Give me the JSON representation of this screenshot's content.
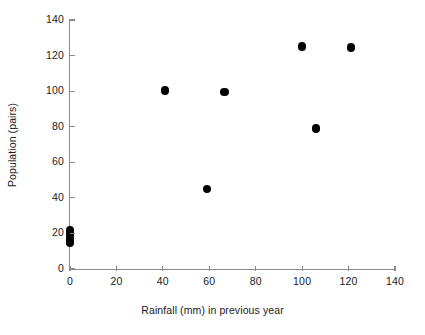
{
  "chart_data": {
    "type": "scatter",
    "title": "",
    "xlabel": "Rainfall (mm) in previous year",
    "ylabel": "Population (pairs)",
    "xlim": [
      0,
      140
    ],
    "ylim": [
      0,
      140
    ],
    "xticks": [
      0,
      20,
      40,
      60,
      80,
      100,
      120,
      140
    ],
    "yticks": [
      0,
      20,
      40,
      60,
      80,
      100,
      120,
      140
    ],
    "xtick_labels": [
      "0",
      "20",
      "40",
      "60",
      "80",
      "100",
      "120",
      "140"
    ],
    "ytick_labels": [
      "0",
      "20",
      "40",
      "60",
      "80",
      "100",
      "120",
      "140"
    ],
    "grid": false,
    "legend": null,
    "marker": {
      "shape": "circle",
      "color": "#000000",
      "size_px": 8.5
    },
    "axis_color": "#8a8a8a",
    "background": "#ffffff",
    "series": [
      {
        "name": "Population vs rainfall",
        "points": [
          {
            "x": 0,
            "y": 22
          },
          {
            "x": 0,
            "y": 20
          },
          {
            "x": 0,
            "y": 19
          },
          {
            "x": 0,
            "y": 17
          },
          {
            "x": 0,
            "y": 16
          },
          {
            "x": 0,
            "y": 15
          },
          {
            "x": 41,
            "y": 100.5
          },
          {
            "x": 59,
            "y": 45
          },
          {
            "x": 66.5,
            "y": 99.5
          },
          {
            "x": 100,
            "y": 125
          },
          {
            "x": 106,
            "y": 79
          },
          {
            "x": 121,
            "y": 124.5
          }
        ]
      }
    ]
  }
}
